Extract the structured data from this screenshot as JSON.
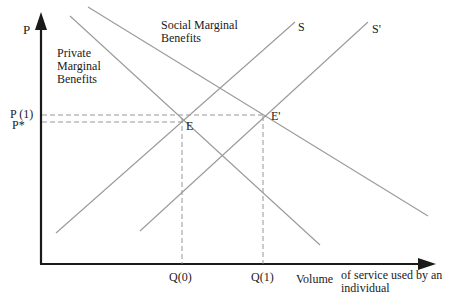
{
  "diagram": {
    "type": "supply-demand-externality",
    "axes": {
      "y_label": "P",
      "x_label_part1": "Volume",
      "x_label_part2_line1": "of service used by  an",
      "x_label_part2_line2": "individual"
    },
    "curves": {
      "private_mb_line1": "Private",
      "private_mb_line2": "Marginal",
      "private_mb_line3": "Benefits",
      "social_mb_line1": "Social Marginal",
      "social_mb_line2": "Benefits",
      "supply": "S",
      "supply_shifted": "S'"
    },
    "points": {
      "equilibrium": "E",
      "equilibrium_shifted": "E'"
    },
    "price_ticks": {
      "p1": "P (1)",
      "p_star": "P*"
    },
    "quantity_ticks": {
      "q0": "Q(0)",
      "q1": "Q(1)"
    },
    "colors": {
      "axis": "#1a1a1a",
      "curve": "#9a9a9a",
      "guide": "#8a8a8a",
      "text": "#1a1a1a"
    }
  }
}
